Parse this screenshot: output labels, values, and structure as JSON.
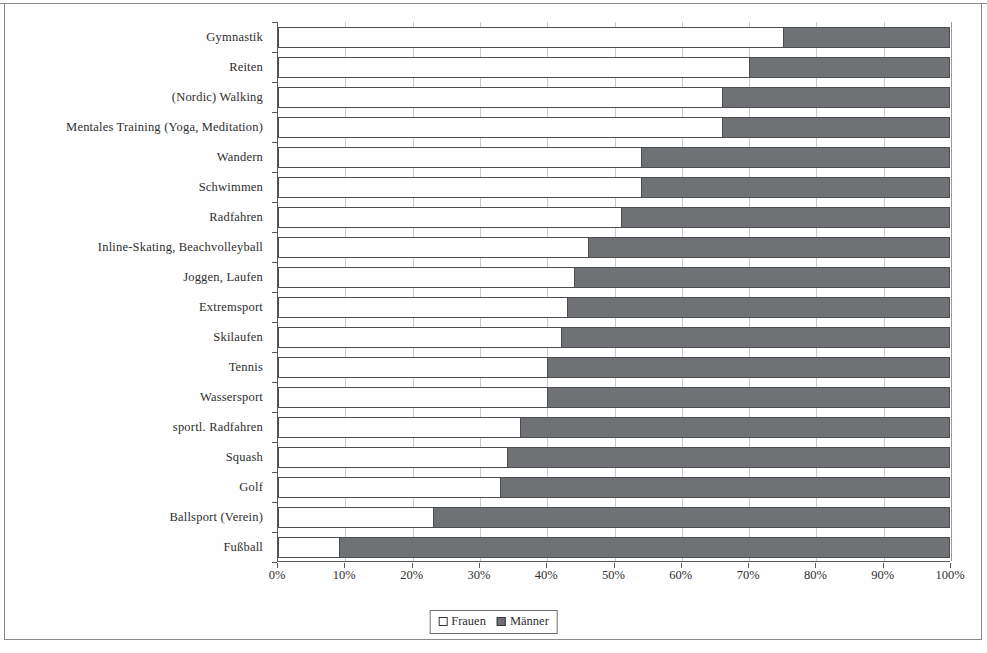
{
  "chart_data": {
    "type": "bar",
    "orientation": "horizontal",
    "stacked": true,
    "normalized": true,
    "title": "",
    "subtitle": "",
    "xlabel": "",
    "ylabel": "",
    "xlim": [
      0,
      100
    ],
    "grid": true,
    "legend_position": "bottom",
    "categories": [
      "Gymnastik",
      "Reiten",
      "(Nordic) Walking",
      "Mentales Training (Yoga, Meditation)",
      "Wandern",
      "Schwimmen",
      "Radfahren",
      "Inline-Skating, Beachvolleyball",
      "Joggen, Laufen",
      "Extremsport",
      "Skilaufen",
      "Tennis",
      "Wassersport",
      "sportl. Radfahren",
      "Squash",
      "Golf",
      "Ballsport (Verein)",
      "Fußball"
    ],
    "series": [
      {
        "name": "Frauen",
        "color": "#ffffff",
        "values": [
          75,
          70,
          66,
          66,
          54,
          54,
          51,
          46,
          44,
          43,
          42,
          40,
          40,
          36,
          34,
          33,
          23,
          9
        ]
      },
      {
        "name": "Männer",
        "color": "#6f7174",
        "values": [
          25,
          30,
          34,
          34,
          46,
          46,
          49,
          54,
          56,
          57,
          58,
          60,
          60,
          64,
          66,
          67,
          77,
          91
        ]
      }
    ],
    "xticks": [
      "0%",
      "10%",
      "20%",
      "30%",
      "40%",
      "50%",
      "60%",
      "70%",
      "80%",
      "90%",
      "100%"
    ],
    "xtick_values": [
      0,
      10,
      20,
      30,
      40,
      50,
      60,
      70,
      80,
      90,
      100
    ]
  },
  "legend": {
    "items": [
      {
        "label": "Frauen"
      },
      {
        "label": "Männer"
      }
    ]
  }
}
